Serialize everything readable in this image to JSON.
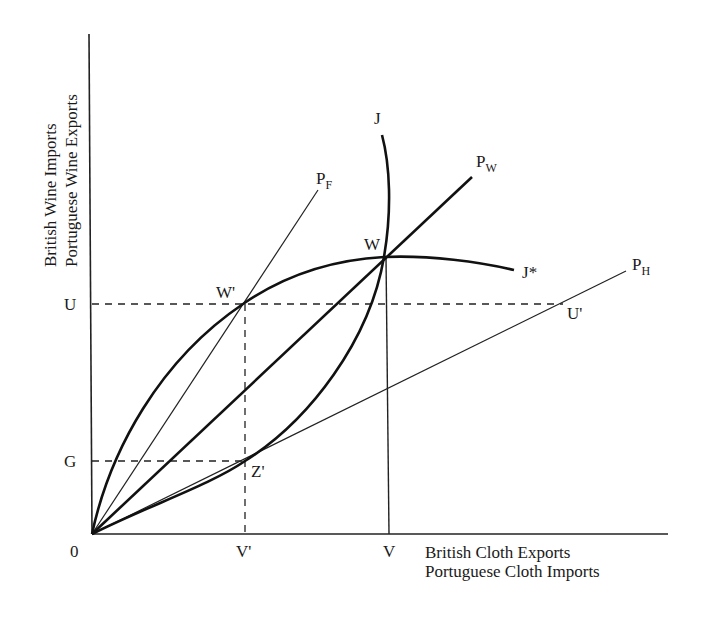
{
  "diagram": {
    "type": "offer-curve trade diagram",
    "y_axis_title": [
      "British Wine Imports",
      "Portuguese Wine Exports"
    ],
    "x_axis_title": [
      "British Cloth Exports",
      "Portuguese Cloth Imports"
    ],
    "origin_label": "0",
    "y_ticks": [
      {
        "label": "U",
        "y": 304
      },
      {
        "label": "G",
        "y": 461
      }
    ],
    "x_ticks": [
      {
        "label": "V'",
        "x": 245
      },
      {
        "label": "V",
        "x": 389
      }
    ],
    "points": {
      "W": {
        "label": "W",
        "x": 384,
        "y": 257
      },
      "W_prime": {
        "label": "W'",
        "x": 243,
        "y": 304
      },
      "Z_prime": {
        "label": "Z'",
        "x": 245,
        "y": 461
      },
      "U_prime": {
        "label": "U'",
        "x": 563,
        "y": 304
      }
    },
    "curves": {
      "J": {
        "label": "J",
        "description": "Portuguese offer curve, rising steeply through W"
      },
      "J_star": {
        "label": "J",
        "label_suffix": "*",
        "description": "British offer curve, bowing up through W' and W"
      }
    },
    "price_lines": {
      "P_F": {
        "label": "P",
        "subscript": "F"
      },
      "P_W": {
        "label": "P",
        "subscript": "W"
      },
      "P_H": {
        "label": "P",
        "subscript": "H"
      }
    },
    "colors": {
      "ink": "#1a1a1a",
      "background": "#ffffff"
    }
  }
}
